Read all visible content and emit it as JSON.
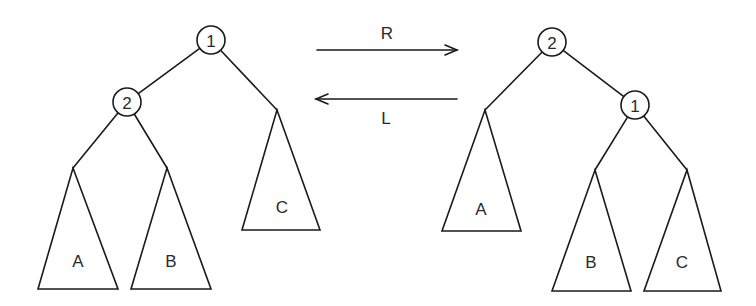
{
  "diagram": {
    "title": "",
    "colors": {
      "stroke": "#1a1a1a",
      "text": "#2a2a2a",
      "background": "#ffffff"
    },
    "left_tree": {
      "root": {
        "label": "1",
        "cx": 211,
        "cy": 40,
        "r": 14
      },
      "child": {
        "label": "2",
        "cx": 127,
        "cy": 102,
        "r": 14
      },
      "subtrees": [
        {
          "label": "A",
          "apex": [
            73,
            168
          ],
          "base": [
            [
              38,
              289
            ],
            [
              118,
              289
            ]
          ],
          "text_pos": [
            78,
            261
          ]
        },
        {
          "label": "B",
          "apex": [
            167,
            168
          ],
          "base": [
            [
              131,
              289
            ],
            [
              211,
              289
            ]
          ],
          "text_pos": [
            171,
            261
          ]
        },
        {
          "label": "C",
          "apex": [
            277,
            110
          ],
          "base": [
            [
              242,
              230
            ],
            [
              320,
              230
            ]
          ],
          "text_pos": [
            282,
            207
          ]
        }
      ]
    },
    "right_tree": {
      "root": {
        "label": "2",
        "cx": 552,
        "cy": 42,
        "r": 14
      },
      "child": {
        "label": "1",
        "cx": 635,
        "cy": 105,
        "r": 14
      },
      "subtrees": [
        {
          "label": "A",
          "apex": [
            485,
            110
          ],
          "base": [
            [
              442,
              231
            ],
            [
              521,
              231
            ]
          ],
          "text_pos": [
            481,
            209
          ]
        },
        {
          "label": "B",
          "apex": [
            595,
            170
          ],
          "base": [
            [
              552,
              291
            ],
            [
              631,
              291
            ]
          ],
          "text_pos": [
            591,
            262
          ]
        },
        {
          "label": "C",
          "apex": [
            687,
            170
          ],
          "base": [
            [
              644,
              291
            ],
            [
              721,
              291
            ]
          ],
          "text_pos": [
            682,
            262
          ]
        }
      ]
    },
    "arrows": [
      {
        "label": "R",
        "direction": "right",
        "x1": 317,
        "x2": 457,
        "y": 50,
        "label_pos": [
          387,
          33
        ]
      },
      {
        "label": "L",
        "direction": "left",
        "x1": 457,
        "x2": 316,
        "y": 99,
        "label_pos": [
          386,
          118
        ]
      }
    ]
  }
}
